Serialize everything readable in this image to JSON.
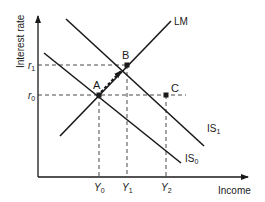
{
  "diagram": {
    "axes": {
      "y_label": "Interest rate",
      "x_label": "Income"
    },
    "curves": {
      "lm": "LM",
      "is0": "IS",
      "is0_sub": "0",
      "is1": "IS",
      "is1_sub": "1"
    },
    "points": {
      "a": "A",
      "b": "B",
      "c": "C"
    },
    "y_ticks": {
      "r1": "r",
      "r1_sub": "1",
      "r0": "r",
      "r0_sub": "0"
    },
    "x_ticks": {
      "y0": "Y",
      "y0_sub": "0",
      "y1": "Y",
      "y1_sub": "1",
      "y2": "Y",
      "y2_sub": "2"
    },
    "colors": {
      "line": "#1a1a1a",
      "background": "#ffffff"
    }
  }
}
